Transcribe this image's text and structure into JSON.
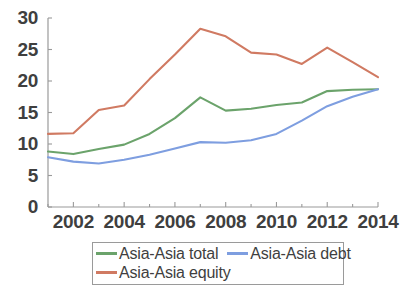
{
  "chart_data": {
    "type": "line",
    "title": "",
    "subtitle": "",
    "xlabel": "",
    "ylabel": "",
    "x": [
      2001,
      2002,
      2003,
      2004,
      2005,
      2006,
      2007,
      2008,
      2009,
      2010,
      2011,
      2012,
      2013,
      2014
    ],
    "xlim": [
      2001,
      2014
    ],
    "ylim": [
      0,
      30
    ],
    "xticks": [
      2002,
      2004,
      2006,
      2008,
      2010,
      2012,
      2014
    ],
    "xtick_labels": [
      "2002",
      "2004",
      "2006",
      "2008",
      "2010",
      "2012",
      "2014"
    ],
    "yticks": [
      0,
      5,
      10,
      15,
      20,
      25,
      30
    ],
    "ytick_labels": [
      "0",
      "5",
      "10",
      "15",
      "20",
      "25",
      "30"
    ],
    "grid": false,
    "legend_position": "below-axes",
    "series": [
      {
        "name": "Asia-Asia total",
        "color": "#6ba36b",
        "values": [
          8.8,
          8.4,
          9.2,
          9.9,
          11.6,
          14.1,
          17.4,
          15.3,
          15.6,
          16.2,
          16.6,
          18.4,
          18.6,
          18.7
        ]
      },
      {
        "name": "Asia-Asia debt",
        "color": "#7e9ee0",
        "values": [
          7.9,
          7.2,
          6.9,
          7.5,
          8.3,
          9.3,
          10.3,
          10.2,
          10.6,
          11.6,
          13.7,
          16.0,
          17.5,
          18.7
        ]
      },
      {
        "name": "Asia-Asia equity",
        "color": "#d07a62",
        "values": [
          11.6,
          11.7,
          15.4,
          16.1,
          20.3,
          24.2,
          28.3,
          27.1,
          24.5,
          24.2,
          22.7,
          25.3,
          23.0,
          20.6
        ]
      }
    ]
  },
  "axes": {
    "axis_color": "#9a9a9a",
    "tick_color": "#9a9a9a"
  },
  "legend": {
    "row1": [
      {
        "label": "Asia-Asia total",
        "color": "#6ba36b"
      },
      {
        "label": "Asia-Asia debt",
        "color": "#7e9ee0"
      }
    ],
    "row2": [
      {
        "label": "Asia-Asia equity",
        "color": "#d07a62"
      }
    ]
  }
}
